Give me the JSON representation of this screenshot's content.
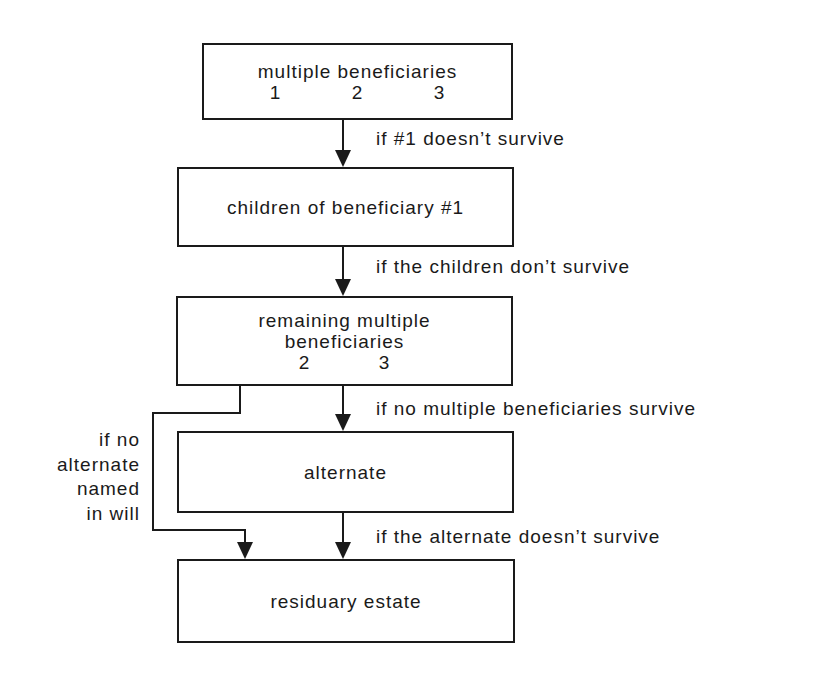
{
  "diagram": {
    "type": "flowchart",
    "boxes": [
      {
        "id": "multiple-beneficiaries",
        "label": "multiple beneficiaries",
        "numbers": [
          "1",
          "2",
          "3"
        ]
      },
      {
        "id": "children-of-beneficiary-1",
        "label": "children of beneficiary #1"
      },
      {
        "id": "remaining-multiple-beneficiaries",
        "label_line1": "remaining multiple",
        "label_line2": "beneficiaries",
        "numbers": [
          "2",
          "3"
        ]
      },
      {
        "id": "alternate",
        "label": "alternate"
      },
      {
        "id": "residuary-estate",
        "label": "residuary estate"
      }
    ],
    "edges": [
      {
        "from": "multiple-beneficiaries",
        "to": "children-of-beneficiary-1",
        "label": "if #1 doesn’t survive"
      },
      {
        "from": "children-of-beneficiary-1",
        "to": "remaining-multiple-beneficiaries",
        "label": "if the children don’t survive"
      },
      {
        "from": "remaining-multiple-beneficiaries",
        "to": "alternate",
        "label": "if no multiple beneficiaries survive"
      },
      {
        "from": "alternate",
        "to": "residuary-estate",
        "label": "if the alternate doesn’t survive"
      },
      {
        "from": "remaining-multiple-beneficiaries",
        "to": "residuary-estate",
        "label_lines": [
          "if no",
          "alternate",
          "named",
          "in will"
        ]
      }
    ],
    "colors": {
      "line": "#1a1a1a",
      "background": "#ffffff"
    }
  }
}
